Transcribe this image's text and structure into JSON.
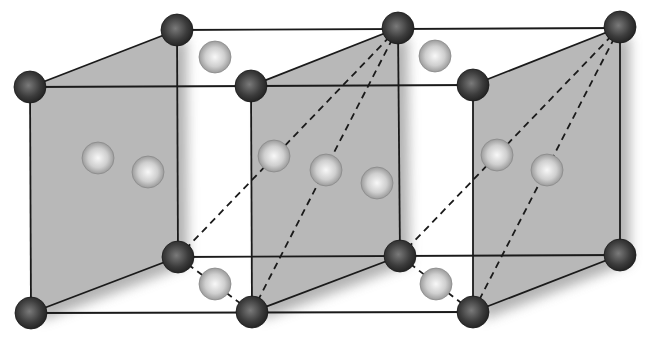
{
  "diagram": {
    "colors": {
      "background": "#ffffff",
      "plane_fill": "#b8b8b8",
      "edge": "#1a1a1a",
      "dark_atom": "#3a3a3a",
      "light_atom": "#c8c8c8"
    },
    "dark_atoms": [
      {
        "x": 177,
        "y": 30
      },
      {
        "x": 398,
        "y": 28
      },
      {
        "x": 620,
        "y": 27
      },
      {
        "x": 30,
        "y": 87
      },
      {
        "x": 251,
        "y": 86
      },
      {
        "x": 473,
        "y": 85
      },
      {
        "x": 178,
        "y": 257
      },
      {
        "x": 400,
        "y": 256
      },
      {
        "x": 620,
        "y": 255
      },
      {
        "x": 31,
        "y": 313
      },
      {
        "x": 252,
        "y": 312
      },
      {
        "x": 473,
        "y": 312
      }
    ],
    "light_atoms": [
      {
        "x": 215,
        "y": 57
      },
      {
        "x": 435,
        "y": 56
      },
      {
        "x": 98,
        "y": 158
      },
      {
        "x": 148,
        "y": 172
      },
      {
        "x": 274,
        "y": 156
      },
      {
        "x": 326,
        "y": 170
      },
      {
        "x": 377,
        "y": 183
      },
      {
        "x": 497,
        "y": 155
      },
      {
        "x": 547,
        "y": 170
      },
      {
        "x": 215,
        "y": 284
      },
      {
        "x": 436,
        "y": 284
      }
    ],
    "planes": [
      {
        "points": "30,87 177,30 178,257 31,313"
      },
      {
        "points": "251,86 398,28 400,256 252,312"
      },
      {
        "points": "473,85 620,27 620,255 473,312"
      }
    ],
    "solid_edges": [
      {
        "x1": 177,
        "y1": 30,
        "x2": 620,
        "y2": 28
      },
      {
        "x1": 30,
        "y1": 87,
        "x2": 473,
        "y2": 85
      },
      {
        "x1": 178,
        "y1": 257,
        "x2": 620,
        "y2": 255
      },
      {
        "x1": 31,
        "y1": 313,
        "x2": 473,
        "y2": 312
      },
      {
        "x1": 30,
        "y1": 87,
        "x2": 31,
        "y2": 313
      },
      {
        "x1": 177,
        "y1": 30,
        "x2": 178,
        "y2": 257
      },
      {
        "x1": 251,
        "y1": 86,
        "x2": 252,
        "y2": 312
      },
      {
        "x1": 398,
        "y1": 28,
        "x2": 400,
        "y2": 256
      },
      {
        "x1": 473,
        "y1": 85,
        "x2": 473,
        "y2": 312
      },
      {
        "x1": 620,
        "y1": 27,
        "x2": 620,
        "y2": 255
      },
      {
        "x1": 30,
        "y1": 87,
        "x2": 177,
        "y2": 30
      },
      {
        "x1": 251,
        "y1": 86,
        "x2": 398,
        "y2": 28
      },
      {
        "x1": 473,
        "y1": 85,
        "x2": 620,
        "y2": 27
      },
      {
        "x1": 31,
        "y1": 313,
        "x2": 178,
        "y2": 257
      },
      {
        "x1": 252,
        "y1": 312,
        "x2": 400,
        "y2": 256
      },
      {
        "x1": 473,
        "y1": 312,
        "x2": 620,
        "y2": 255
      }
    ],
    "dashed_edges": [
      {
        "x1": 398,
        "y1": 28,
        "x2": 178,
        "y2": 257
      },
      {
        "x1": 398,
        "y1": 28,
        "x2": 252,
        "y2": 312
      },
      {
        "x1": 620,
        "y1": 27,
        "x2": 400,
        "y2": 256
      },
      {
        "x1": 620,
        "y1": 27,
        "x2": 473,
        "y2": 312
      },
      {
        "x1": 178,
        "y1": 257,
        "x2": 252,
        "y2": 312
      },
      {
        "x1": 400,
        "y1": 256,
        "x2": 473,
        "y2": 312
      }
    ]
  }
}
